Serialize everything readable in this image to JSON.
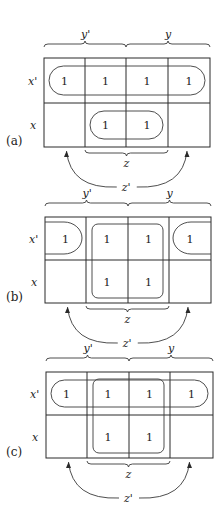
{
  "figure": {
    "row_labels": [
      "x'",
      "x"
    ],
    "top_labels": {
      "left_half": "y'",
      "right_half": "y"
    },
    "bottom_labels": {
      "middle": "z",
      "outer": "z'"
    },
    "colors": {
      "line": "#2a2a2a",
      "background": "#ffffff",
      "text": "#222222"
    }
  },
  "maps": [
    {
      "id": "a",
      "label": "(a)",
      "geometry": {
        "left": 44,
        "right": 210,
        "top": 58,
        "mid": 103,
        "bottom": 147,
        "cols": [
          85,
          126,
          168
        ]
      },
      "cells": [
        [
          "1",
          "1",
          "1",
          "1"
        ],
        [
          "",
          "1",
          "1",
          ""
        ]
      ],
      "groups": [
        {
          "type": "row-pill",
          "row": 0,
          "col_start": 0,
          "col_end": 3
        },
        {
          "type": "row-pill",
          "row": 1,
          "col_start": 1,
          "col_end": 2
        }
      ]
    },
    {
      "id": "b",
      "label": "(b)",
      "geometry": {
        "left": 45,
        "right": 211,
        "top": 217,
        "mid": 260,
        "bottom": 303,
        "cols": [
          86,
          128,
          169
        ]
      },
      "cells": [
        [
          "1",
          "1",
          "1",
          "1"
        ],
        [
          "",
          "1",
          "1",
          ""
        ]
      ],
      "groups": [
        {
          "type": "wrap-pair",
          "row": 0
        },
        {
          "type": "square",
          "row_start": 0,
          "row_end": 1,
          "col_start": 1,
          "col_end": 2
        }
      ]
    },
    {
      "id": "c",
      "label": "(c)",
      "geometry": {
        "left": 46,
        "right": 213,
        "top": 372,
        "mid": 415,
        "bottom": 458,
        "cols": [
          87,
          129,
          170
        ]
      },
      "cells": [
        [
          "1",
          "1",
          "1",
          "1"
        ],
        [
          "",
          "1",
          "1",
          ""
        ]
      ],
      "groups": [
        {
          "type": "row-pill",
          "row": 0,
          "col_start": 0,
          "col_end": 3
        },
        {
          "type": "square",
          "row_start": 0,
          "row_end": 1,
          "col_start": 1,
          "col_end": 2
        }
      ]
    }
  ]
}
